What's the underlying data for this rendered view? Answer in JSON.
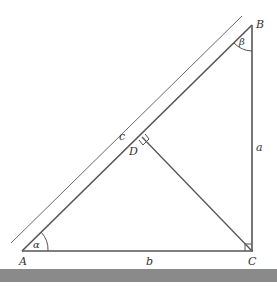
{
  "diagram": {
    "type": "right-triangle-with-altitude",
    "vertices": {
      "A": {
        "label": "A"
      },
      "B": {
        "label": "B"
      },
      "C": {
        "label": "C"
      },
      "D": {
        "label": "D"
      }
    },
    "sides": {
      "a": {
        "label": "a"
      },
      "b": {
        "label": "b"
      },
      "c": {
        "label": "c"
      }
    },
    "angles": {
      "alpha": {
        "label": "α"
      },
      "beta": {
        "label": "β"
      }
    },
    "colors": {
      "line": "#555555",
      "footer_bar": "#8a8a8a"
    }
  }
}
